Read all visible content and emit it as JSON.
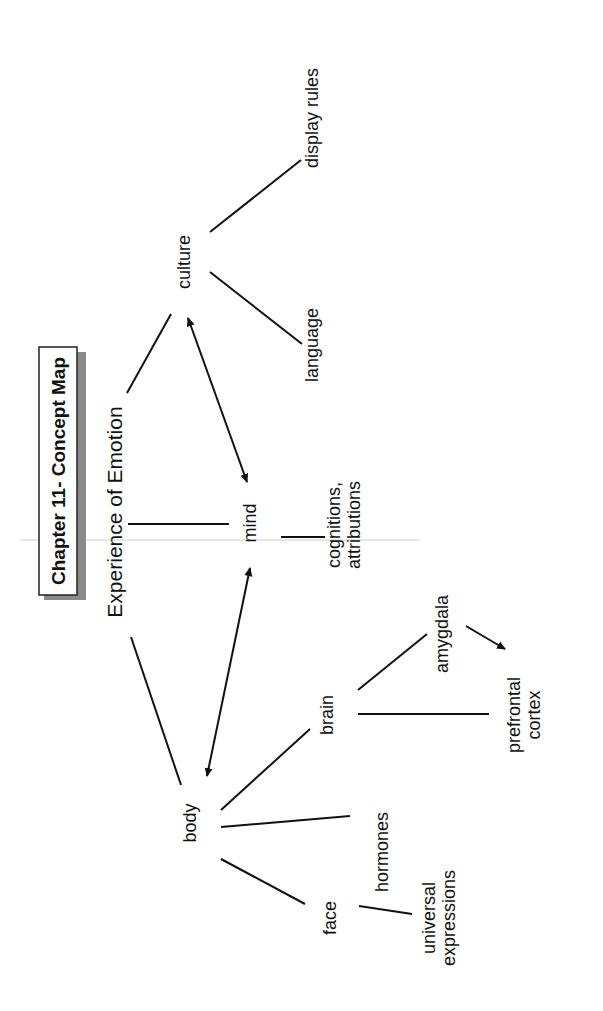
{
  "title": "Chapter 11- Concept Map",
  "root": "Experience of Emotion",
  "nodes": [
    {
      "id": "culture",
      "label": [
        "culture"
      ],
      "x": 190,
      "y": 262,
      "size": 18
    },
    {
      "id": "display_rules",
      "label": [
        "display rules"
      ],
      "x": 318,
      "y": 118,
      "size": 18
    },
    {
      "id": "language",
      "label": [
        "language"
      ],
      "x": 318,
      "y": 345,
      "size": 18
    },
    {
      "id": "mind",
      "label": [
        "mind"
      ],
      "x": 256,
      "y": 523,
      "size": 18
    },
    {
      "id": "cognitions",
      "label": [
        "cognitions,",
        "attributions"
      ],
      "x": 350,
      "y": 525,
      "size": 18
    },
    {
      "id": "body",
      "label": [
        "body"
      ],
      "x": 196,
      "y": 823,
      "size": 18
    },
    {
      "id": "brain",
      "label": [
        "brain"
      ],
      "x": 333,
      "y": 715,
      "size": 18
    },
    {
      "id": "amygdala",
      "label": [
        "amygdala"
      ],
      "x": 448,
      "y": 634,
      "size": 18
    },
    {
      "id": "prefrontal",
      "label": [
        "prefrontal",
        "cortex"
      ],
      "x": 530,
      "y": 715,
      "size": 18
    },
    {
      "id": "hormones",
      "label": [
        "hormones"
      ],
      "x": 388,
      "y": 852,
      "size": 18
    },
    {
      "id": "face",
      "label": [
        "face"
      ],
      "x": 336,
      "y": 918,
      "size": 18
    },
    {
      "id": "universal",
      "label": [
        "universal",
        "expressions"
      ],
      "x": 445,
      "y": 918,
      "size": 18
    }
  ],
  "edges": [
    {
      "from": "root",
      "to": "culture",
      "x1": 127,
      "y1": 393,
      "x2": 171,
      "y2": 314,
      "arrow": "none"
    },
    {
      "from": "root",
      "to": "mind",
      "x1": 128,
      "y1": 524,
      "x2": 229,
      "y2": 524,
      "arrow": "none"
    },
    {
      "from": "root",
      "to": "body",
      "x1": 131,
      "y1": 637,
      "x2": 181,
      "y2": 785,
      "arrow": "none"
    },
    {
      "from": "culture",
      "to": "display_rules",
      "x1": 210,
      "y1": 232,
      "x2": 301,
      "y2": 160,
      "arrow": "none"
    },
    {
      "from": "culture",
      "to": "language",
      "x1": 210,
      "y1": 272,
      "x2": 302,
      "y2": 344,
      "arrow": "none"
    },
    {
      "from": "culture",
      "to": "mind",
      "x1": 188,
      "y1": 318,
      "x2": 247,
      "y2": 482,
      "arrow": "both"
    },
    {
      "from": "mind",
      "to": "cognitions",
      "x1": 281,
      "y1": 537,
      "x2": 325,
      "y2": 537,
      "arrow": "none"
    },
    {
      "from": "mind",
      "to": "body",
      "x1": 250,
      "y1": 568,
      "x2": 207,
      "y2": 776,
      "arrow": "both"
    },
    {
      "from": "body",
      "to": "brain",
      "x1": 221,
      "y1": 810,
      "x2": 310,
      "y2": 729,
      "arrow": "none"
    },
    {
      "from": "body",
      "to": "hormones",
      "x1": 221,
      "y1": 827,
      "x2": 350,
      "y2": 816,
      "arrow": "none"
    },
    {
      "from": "body",
      "to": "face",
      "x1": 221,
      "y1": 859,
      "x2": 305,
      "y2": 904,
      "arrow": "none"
    },
    {
      "from": "brain",
      "to": "amygdala",
      "x1": 358,
      "y1": 690,
      "x2": 427,
      "y2": 634,
      "arrow": "none"
    },
    {
      "from": "brain",
      "to": "prefrontal",
      "x1": 358,
      "y1": 714,
      "x2": 489,
      "y2": 714,
      "arrow": "none"
    },
    {
      "from": "amygdala",
      "to": "prefrontal",
      "x1": 466,
      "y1": 626,
      "x2": 505,
      "y2": 649,
      "arrow": "end"
    },
    {
      "from": "face",
      "to": "universal",
      "x1": 359,
      "y1": 906,
      "x2": 412,
      "y2": 914,
      "arrow": "none"
    }
  ]
}
